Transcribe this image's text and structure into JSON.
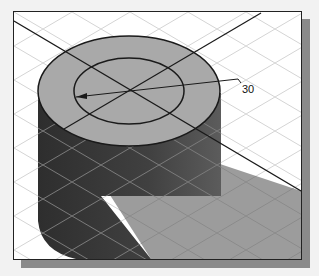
{
  "figure": {
    "type": "isometric-cad-view",
    "object": "cylinder",
    "dimension": {
      "label": "30",
      "kind": "diameter"
    },
    "colors": {
      "background": "#ffffff",
      "grid": "#d0d0d0",
      "top_face": "#a9a9a9",
      "side_dark": "#3a3a3a",
      "side_mid": "#5a5a5a",
      "shadow": "#9c9c9c",
      "frame_shadow": "#8a8a8a",
      "lines": "#1a1a1a"
    }
  }
}
